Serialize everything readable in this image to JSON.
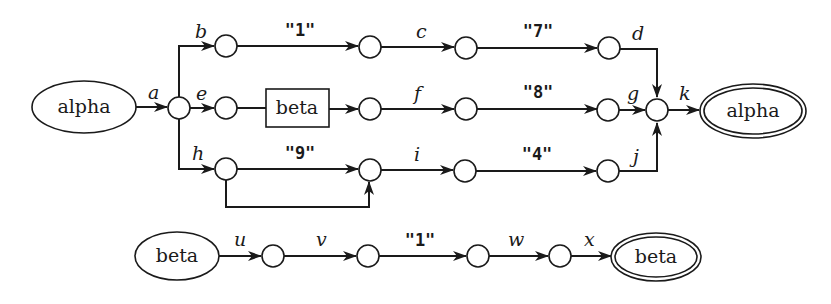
{
  "diagram": {
    "type": "transition-network",
    "networks": [
      {
        "name": "alpha",
        "start_label": "alpha",
        "end_label": "alpha",
        "edges": {
          "a": "a",
          "b": "b",
          "c": "c",
          "d": "d",
          "e": "e",
          "f": "f",
          "g": "g",
          "h": "h",
          "i": "i",
          "j": "j",
          "k": "k"
        },
        "strings": {
          "top1": "\"1\"",
          "top2": "\"7\"",
          "mid2": "\"8\"",
          "bot1": "\"9\"",
          "bot2": "\"4\""
        },
        "subnet_box": "beta"
      },
      {
        "name": "beta",
        "start_label": "beta",
        "end_label": "beta",
        "edges": {
          "u": "u",
          "v": "v",
          "w": "w",
          "x": "x"
        },
        "strings": {
          "s1": "\"1\""
        }
      }
    ]
  }
}
